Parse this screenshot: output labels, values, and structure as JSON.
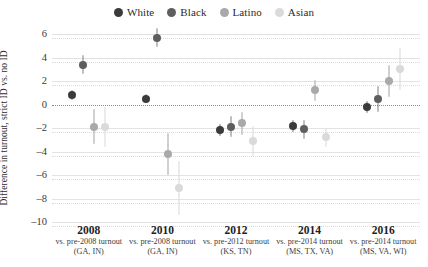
{
  "chart_data": {
    "type": "scatter",
    "title": "",
    "xlabel": "",
    "ylabel": "Difference in turnout, strict ID vs. no ID",
    "ylim": [
      -10,
      6
    ],
    "yticks": [
      6,
      4,
      2,
      0,
      -2,
      -4,
      -6,
      -8,
      -10
    ],
    "ytick_labels": [
      "6",
      "4",
      "2",
      "0",
      "-2",
      "-4",
      "-6",
      "-8",
      "-10"
    ],
    "grid": true,
    "zero_reference_line": 0,
    "legend_position": "top-center",
    "legend": [
      {
        "name": "White",
        "color": "#3b3b3b"
      },
      {
        "name": "Black",
        "color": "#5e5e5e"
      },
      {
        "name": "Latino",
        "color": "#a9a9a9"
      },
      {
        "name": "Asian",
        "color": "#dadada"
      }
    ],
    "categories": [
      "2008",
      "2010",
      "2012",
      "2014",
      "2016"
    ],
    "category_sublabels": [
      {
        "line1": "vs. pre-2008 turnout",
        "line2": "(GA, IN)"
      },
      {
        "line1": "vs. pre-2008 turnout",
        "line2": "(GA, IN)"
      },
      {
        "line1": "vs. pre-2012 turnout",
        "line2": "(KS, TN)"
      },
      {
        "line1": "vs. pre-2014 turnout",
        "line2": "(MS, TX, VA)"
      },
      {
        "line1": "vs. pre-2014 turnout",
        "line2": "(MS, VA, WI)"
      }
    ],
    "series": [
      {
        "name": "White",
        "color": "#3b3b3b",
        "values": [
          0.8,
          0.5,
          -2.2,
          -1.8,
          -0.2
        ],
        "ci_low": [
          0.4,
          0.1,
          -2.7,
          -2.3,
          -0.7
        ],
        "ci_high": [
          1.2,
          0.9,
          -1.7,
          -1.3,
          0.3
        ]
      },
      {
        "name": "Black",
        "color": "#5e5e5e",
        "values": [
          3.4,
          5.7,
          -1.9,
          -2.1,
          0.5
        ],
        "ci_low": [
          2.6,
          4.9,
          -2.8,
          -2.9,
          -0.6
        ],
        "ci_high": [
          4.2,
          6.5,
          -1.0,
          -1.3,
          1.6
        ]
      },
      {
        "name": "Latino",
        "color": "#a9a9a9",
        "values": [
          -1.9,
          -4.2,
          -1.6,
          1.2,
          2.0
        ],
        "ci_low": [
          -3.4,
          -6.0,
          -2.6,
          0.3,
          0.6
        ],
        "ci_high": [
          -0.4,
          -2.4,
          -0.6,
          2.1,
          3.4
        ]
      },
      {
        "name": "Asian",
        "color": "#dadada",
        "values": [
          -1.9,
          -7.1,
          -3.1,
          -2.8,
          3.0
        ],
        "ci_low": [
          -3.6,
          -9.4,
          -4.4,
          -3.6,
          1.2
        ],
        "ci_high": [
          -0.2,
          -4.8,
          -1.8,
          -2.0,
          4.8
        ]
      }
    ]
  }
}
